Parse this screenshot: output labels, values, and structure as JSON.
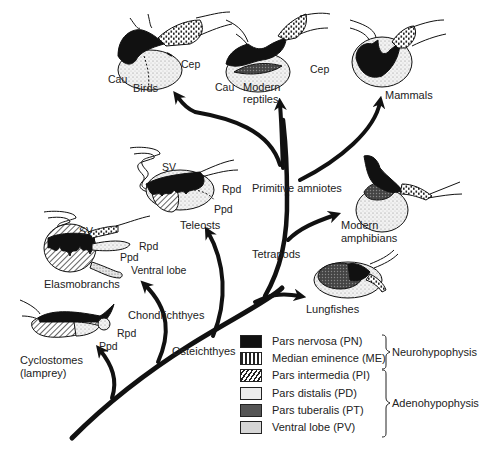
{
  "diagram": {
    "type": "phylogenetic-tree-with-pituitary-illustrations",
    "taxa": [
      {
        "id": "birds",
        "label": "Birds",
        "parts": [
          "Cau",
          "Cep"
        ]
      },
      {
        "id": "modern-reptiles",
        "label_line1": "Modern",
        "label_line2": "reptiles",
        "parts": [
          "Cau",
          "Cep"
        ]
      },
      {
        "id": "mammals",
        "label": "Mammals"
      },
      {
        "id": "teleosts",
        "label": "Teleosts",
        "parts": [
          "SV",
          "Rpd",
          "Ppd"
        ]
      },
      {
        "id": "modern-amphibians",
        "label_line1": "Modern",
        "label_line2": "amphibians"
      },
      {
        "id": "lungfishes",
        "label": "Lungfishes"
      },
      {
        "id": "elasmobranchs",
        "label": "Elasmobranchs",
        "parts": [
          "SV",
          "Rpd",
          "Ppd",
          "Ventral lobe"
        ]
      },
      {
        "id": "cyclostomes",
        "label_line1": "Cyclostomes",
        "label_line2": "(lamprey)",
        "parts": [
          "Rpd",
          "Ppd"
        ]
      }
    ],
    "clades": {
      "primitive_amniotes": "Primitive amniotes",
      "tetrapods": "Tetrapods",
      "chondrichthyes": "Chondrichthyes",
      "osteichthyes": "Osteichthyes"
    },
    "part_labels": {
      "cau": "Cau",
      "cep": "Cep",
      "sv": "SV",
      "rpd": "Rpd",
      "ppd": "Ppd",
      "ventral_lobe": "Ventral lobe"
    }
  },
  "legend": {
    "items": [
      {
        "label": "Pars nervosa (PN)",
        "pattern": "solid-black",
        "group": "Neurohypophysis"
      },
      {
        "label": "Median eminence (ME)",
        "pattern": "dotted-dashes",
        "group": "Neurohypophysis"
      },
      {
        "label": "Pars intermedia (PI)",
        "pattern": "diagonal-hatch",
        "group": "Adenohypophysis"
      },
      {
        "label": "Pars distalis (PD)",
        "pattern": "light-stipple",
        "group": "Adenohypophysis"
      },
      {
        "label": "Pars tuberalis (PT)",
        "pattern": "dark-stipple",
        "group": "Adenohypophysis"
      },
      {
        "label": "Ventral lobe (PV)",
        "pattern": "medium-stipple",
        "group": "Adenohypophysis"
      }
    ],
    "groups": {
      "neurohypophysis": "Neurohypophysis",
      "adenohypophysis": "Adenohypophysis"
    }
  },
  "colors": {
    "ink": "#111111",
    "pd_fill": "#e4e4e4",
    "pt_fill": "#555555",
    "pv_fill": "#d0d0d0",
    "background": "#ffffff"
  }
}
